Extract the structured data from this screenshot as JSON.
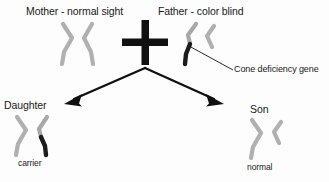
{
  "diagram": {
    "background_color": "#fdfdfd",
    "chromosome_normal_color": "#b0b0b0",
    "chromosome_affected_color": "#1c1c1c",
    "line_color": "#000000",
    "text_color": "#1a1a1a"
  },
  "parents": {
    "mother": {
      "label": "Mother - normal sight",
      "chromosomes": [
        {
          "name": "x-chromosome-left",
          "status": "normal",
          "color": "#b0b0b0"
        },
        {
          "name": "x-chromosome-right",
          "status": "normal",
          "color": "#b0b0b0"
        }
      ]
    },
    "cross_symbol": "+",
    "father": {
      "label": "Father - color blind",
      "chromosomes": [
        {
          "name": "x-chromosome",
          "status": "affected",
          "color": "#1c1c1c"
        },
        {
          "name": "y-chromosome",
          "status": "normal",
          "color": "#b0b0b0"
        }
      ]
    }
  },
  "annotation": {
    "label": "Cone deficiency gene",
    "points_to": "father-x-chromosome-affected-segment"
  },
  "children": {
    "daughter": {
      "label": "Daughter",
      "status": "carrier",
      "chromosomes": [
        {
          "name": "x-chromosome-left",
          "status": "normal",
          "color": "#b0b0b0"
        },
        {
          "name": "x-chromosome-right",
          "status": "affected",
          "color": "#1c1c1c"
        }
      ]
    },
    "son": {
      "label": "Son",
      "status": "normal",
      "chromosomes": [
        {
          "name": "x-chromosome",
          "status": "normal",
          "color": "#b0b0b0"
        },
        {
          "name": "y-chromosome",
          "status": "normal",
          "color": "#b0b0b0"
        }
      ]
    }
  },
  "arrows": [
    {
      "name": "arrow-to-daughter",
      "direction": "down-left"
    },
    {
      "name": "arrow-to-son",
      "direction": "down-right"
    }
  ]
}
